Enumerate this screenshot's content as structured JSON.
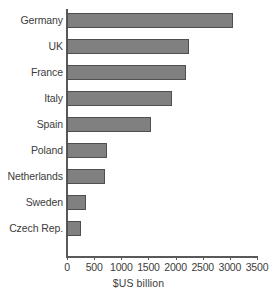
{
  "chart_data": {
    "type": "bar",
    "orientation": "horizontal",
    "title": "",
    "subtitle": "",
    "xlabel": "$US billion",
    "ylabel": "",
    "categories": [
      "Germany",
      "UK",
      "France",
      "Italy",
      "Spain",
      "Poland",
      "Netherlands",
      "Sweden",
      "Czech Rep."
    ],
    "values": [
      3050,
      2250,
      2200,
      1930,
      1550,
      740,
      700,
      350,
      260
    ],
    "series": [
      {
        "name": "GDP",
        "values": [
          3050,
          2250,
          2200,
          1930,
          1550,
          740,
          700,
          350,
          260
        ]
      }
    ],
    "xlim": [
      0,
      3500
    ],
    "xticks": [
      0,
      500,
      1000,
      1500,
      2000,
      2500,
      3000,
      3500
    ],
    "xtick_labels": [
      "0",
      "500",
      "1000",
      "1500",
      "2000",
      "2500",
      "3000",
      "3500"
    ],
    "grid": false,
    "legend": false,
    "legend_position": "none",
    "bar_color": "#808080",
    "bar_edge_color": "#4f4f4f",
    "axis_color": "#595959",
    "text_color": "#3c3c3c",
    "background": "#ffffff"
  },
  "axis": {
    "x_title": "$US billion"
  }
}
